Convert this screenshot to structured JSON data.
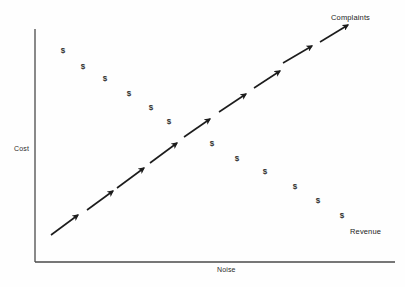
{
  "figure": {
    "background_color": "#fefefe",
    "ink_color": "#1c1c1c",
    "axis_color": "#4a4a4a"
  },
  "axes": {
    "y_axis_label": "Cost",
    "x_axis_label": "Noise",
    "origin": {
      "x": 35,
      "y": 262
    },
    "y_top": 29,
    "x_right": 395
  },
  "series_labels": {
    "rising": "Complaints",
    "falling": "Revenue"
  },
  "chart_data": {
    "type": "scatter",
    "title": "",
    "xlabel": "Noise",
    "ylabel": "Cost",
    "xlim": [
      0,
      10
    ],
    "ylim": [
      0,
      10
    ],
    "grid": false,
    "legend_position": "inline-endpoint-labels",
    "annotations": [
      {
        "text": "Complaints",
        "x": 331,
        "y": 13,
        "series": "rising"
      },
      {
        "text": "Revenue",
        "x": 350,
        "y": 227,
        "series": "falling"
      },
      {
        "text": "Cost",
        "x": 14,
        "y": 145,
        "role": "y-axis-label"
      },
      {
        "text": "Noise",
        "x": 217,
        "y": 266,
        "role": "x-axis-label"
      }
    ],
    "series": [
      {
        "name": "Complaints",
        "marker": "arrow",
        "trend": "increasing",
        "description": "Chain of nine short arrows rising from lower-left to upper-right",
        "arrows": [
          {
            "x1": 51,
            "y1": 235,
            "x2": 78,
            "y2": 215
          },
          {
            "x1": 87,
            "y1": 210,
            "x2": 113,
            "y2": 191
          },
          {
            "x1": 117,
            "y1": 188,
            "x2": 144,
            "y2": 168
          },
          {
            "x1": 150,
            "y1": 163,
            "x2": 177,
            "y2": 143
          },
          {
            "x1": 184,
            "y1": 137,
            "x2": 210,
            "y2": 119
          },
          {
            "x1": 219,
            "y1": 112,
            "x2": 246,
            "y2": 94
          },
          {
            "x1": 254,
            "y1": 88,
            "x2": 280,
            "y2": 71
          },
          {
            "x1": 283,
            "y1": 63,
            "x2": 312,
            "y2": 46
          },
          {
            "x1": 320,
            "y1": 42,
            "x2": 348,
            "y2": 25
          }
        ]
      },
      {
        "name": "Revenue",
        "marker": "$",
        "trend": "decreasing",
        "description": "Twelve dollar-sign markers descending from upper-left to lower-right",
        "points": [
          {
            "x": 63,
            "y": 51,
            "symbol": "$"
          },
          {
            "x": 83,
            "y": 67,
            "symbol": "$"
          },
          {
            "x": 105,
            "y": 79,
            "symbol": "$"
          },
          {
            "x": 129,
            "y": 94,
            "symbol": "$"
          },
          {
            "x": 151,
            "y": 108,
            "symbol": "$"
          },
          {
            "x": 169,
            "y": 122,
            "symbol": "$"
          },
          {
            "x": 212,
            "y": 144,
            "symbol": "$"
          },
          {
            "x": 237,
            "y": 159,
            "symbol": "$"
          },
          {
            "x": 265,
            "y": 172,
            "symbol": "$"
          },
          {
            "x": 295,
            "y": 187,
            "symbol": "$"
          },
          {
            "x": 318,
            "y": 201,
            "symbol": "$"
          },
          {
            "x": 342,
            "y": 216,
            "symbol": "$"
          }
        ]
      }
    ]
  }
}
